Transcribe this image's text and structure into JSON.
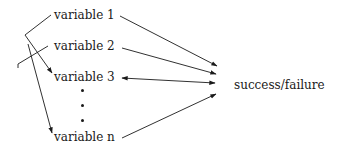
{
  "diagram": {
    "variables": [
      {
        "id": "v1",
        "label": "variable 1"
      },
      {
        "id": "v2",
        "label": "variable 2"
      },
      {
        "id": "v3",
        "label": "variable 3"
      },
      {
        "id": "vn",
        "label": "variable n"
      }
    ],
    "ellipsis": [
      "•",
      "•",
      "•"
    ],
    "outcome": {
      "label": "success/failure"
    },
    "edges": [
      {
        "from": "variable 1",
        "to": "variable 3",
        "type": "arrow"
      },
      {
        "from": "variable 2",
        "to": "variable n",
        "type": "arrow"
      },
      {
        "from": "variable 1",
        "to": "success/failure",
        "type": "arrow"
      },
      {
        "from": "variable 2",
        "to": "success/failure",
        "type": "arrow"
      },
      {
        "from": "variable 3",
        "to": "success/failure",
        "type": "bidirectional"
      },
      {
        "from": "variable n",
        "to": "success/failure",
        "type": "arrow"
      }
    ],
    "colors": {
      "ink": "#1a1a1a",
      "background": "#ffffff"
    }
  }
}
